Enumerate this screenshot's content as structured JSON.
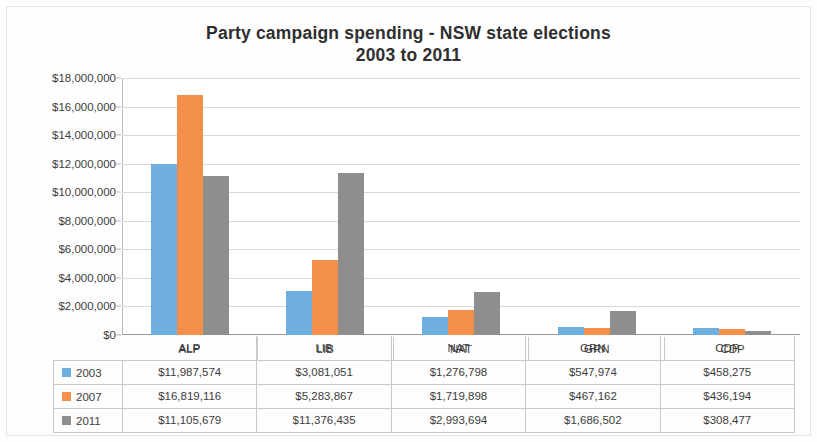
{
  "chart_data": {
    "type": "bar",
    "title": "Party campaign spending -  NSW state elections",
    "subtitle": "2003 to 2011",
    "xlabel": "",
    "ylabel": "",
    "ylim": [
      0,
      18000000
    ],
    "ytick_step": 2000000,
    "grid": true,
    "legend_position": "data-table",
    "categories": [
      "ALP",
      "LIB",
      "NAT",
      "GRN",
      "CDP"
    ],
    "ytick_labels": [
      "$18,000,000",
      "$16,000,000",
      "$14,000,000",
      "$12,000,000",
      "$10,000,000",
      "$8,000,000",
      "$6,000,000",
      "$4,000,000",
      "$2,000,000",
      "$0"
    ],
    "ytick_values": [
      18000000,
      16000000,
      14000000,
      12000000,
      10000000,
      8000000,
      6000000,
      4000000,
      2000000,
      0
    ],
    "series": [
      {
        "name": "2003",
        "color": "#6FAFE0",
        "values": [
          11987574,
          3081051,
          1276798,
          547974,
          458275
        ],
        "labels": [
          "$11,987,574",
          "$3,081,051",
          "$1,276,798",
          "$547,974",
          "$458,275"
        ]
      },
      {
        "name": "2007",
        "color": "#F5904B",
        "values": [
          16819116,
          5283867,
          1719898,
          467162,
          436194
        ],
        "labels": [
          "$16,819,116",
          "$5,283,867",
          "$1,719,898",
          "$467,162",
          "$436,194"
        ]
      },
      {
        "name": "2011",
        "color": "#8E8E8E",
        "values": [
          11105679,
          11376435,
          2993694,
          1686502,
          308477
        ],
        "labels": [
          "$11,105,679",
          "$11,376,435",
          "$2,993,694",
          "$1,686,502",
          "$308,477"
        ]
      }
    ]
  }
}
